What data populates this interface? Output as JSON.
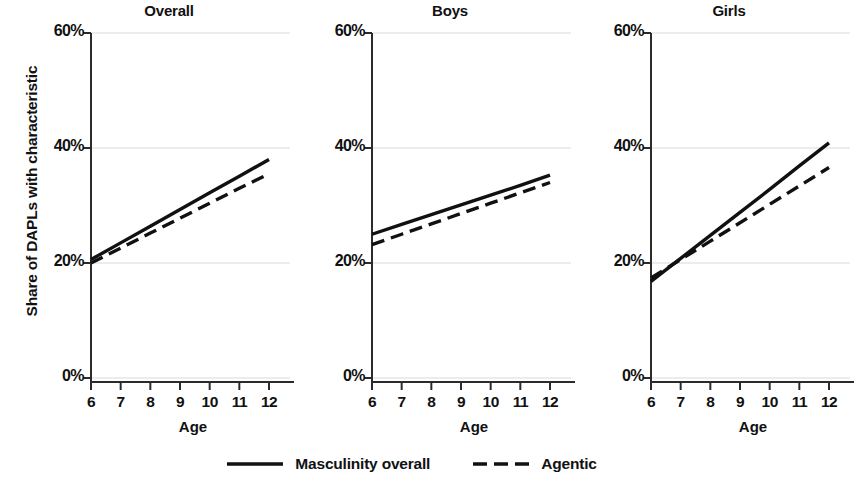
{
  "chart_data": {
    "type": "line",
    "title": "",
    "xlabel": "Age",
    "ylabel": "Share of DAPLs with characteristic",
    "xlim": [
      5.6,
      12.4
    ],
    "ylim": [
      0,
      62
    ],
    "xticks": [
      6,
      7,
      8,
      9,
      10,
      11,
      12
    ],
    "xticklabels": [
      "6",
      "7",
      "8",
      "9",
      "10",
      "11",
      "12"
    ],
    "yticks": [
      0,
      20,
      40,
      60
    ],
    "yticklabels": [
      "0%",
      "20%",
      "40%",
      "60%"
    ],
    "grid": "horizontal",
    "legend_position": "bottom-center",
    "line_color": "#111111",
    "panels": [
      {
        "title": "Overall",
        "x": [
          6,
          7,
          8,
          9,
          10,
          11,
          12
        ],
        "series": [
          {
            "name": "Masculinity overall",
            "style": "solid",
            "values": [
              20.6,
              23.5,
              26.4,
              29.3,
              32.2,
              35.1,
              38.0
            ]
          },
          {
            "name": "Agentic",
            "style": "dashed",
            "values": [
              20.0,
              22.6,
              25.2,
              27.8,
              30.4,
              33.0,
              35.5
            ]
          }
        ]
      },
      {
        "title": "Boys",
        "x": [
          6,
          7,
          8,
          9,
          10,
          11,
          12
        ],
        "series": [
          {
            "name": "Masculinity overall",
            "style": "solid",
            "values": [
              25.0,
              26.7,
              28.4,
              30.1,
              31.8,
              33.5,
              35.3
            ]
          },
          {
            "name": "Agentic",
            "style": "dashed",
            "values": [
              23.2,
              25.0,
              26.8,
              28.6,
              30.4,
              32.2,
              34.0
            ]
          }
        ]
      },
      {
        "title": "Girls",
        "x": [
          6,
          7,
          8,
          9,
          10,
          11,
          12
        ],
        "series": [
          {
            "name": "Masculinity overall",
            "style": "solid",
            "values": [
              16.8,
              20.8,
              24.8,
              28.8,
              32.8,
              36.9,
              40.9
            ]
          },
          {
            "name": "Agentic",
            "style": "dashed",
            "values": [
              17.4,
              20.6,
              23.8,
              27.0,
              30.2,
              33.4,
              36.6
            ]
          }
        ]
      }
    ],
    "legend": [
      {
        "label": "Masculinity overall",
        "style": "solid"
      },
      {
        "label": "Agentic",
        "style": "dashed"
      }
    ]
  }
}
